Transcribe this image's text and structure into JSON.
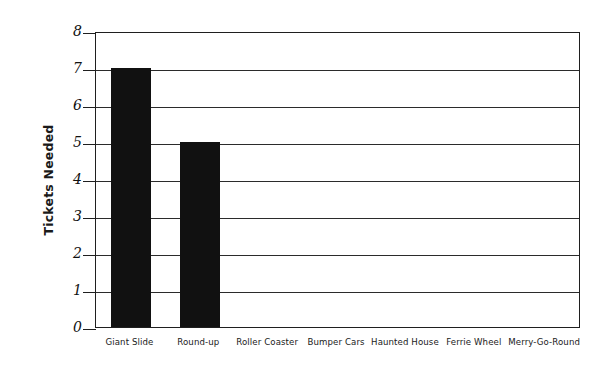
{
  "chart_data": {
    "type": "bar",
    "title": "",
    "subtitle": "",
    "xlabel": "",
    "ylabel": "Tickets Needed",
    "categories": [
      "Giant Slide",
      "Round-up",
      "Roller Coaster",
      "Bumper Cars",
      "Haunted House",
      "Ferrie Wheel",
      "Merry-Go-Round"
    ],
    "values": [
      7,
      5,
      0,
      0,
      0,
      0,
      0
    ],
    "ylim": [
      0,
      8
    ],
    "ytick_labels": [
      "0",
      "1",
      "2",
      "3",
      "4",
      "5",
      "6",
      "7",
      "8"
    ],
    "ytick_values": [
      0,
      1,
      2,
      3,
      4,
      5,
      6,
      7,
      8
    ],
    "grid": true,
    "grid_axis": "y",
    "legend": false,
    "legend_position": "none",
    "bar_color": "#111111",
    "axis_color": "#1f1f1f",
    "grid_color": "#2b2b2b",
    "background_color": "#ffffff"
  }
}
